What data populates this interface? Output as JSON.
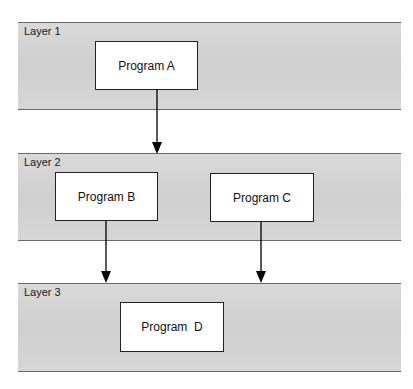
{
  "diagram": {
    "layers": [
      {
        "id": "layer1",
        "label": "Layer 1"
      },
      {
        "id": "layer2",
        "label": "Layer 2"
      },
      {
        "id": "layer3",
        "label": "Layer 3"
      }
    ],
    "programs": [
      {
        "id": "A",
        "label": "Program A",
        "layer": "layer1"
      },
      {
        "id": "B",
        "label": "Program B",
        "layer": "layer2"
      },
      {
        "id": "C",
        "label": "Program C",
        "layer": "layer2"
      },
      {
        "id": "D",
        "label": "Program  D",
        "layer": "layer3"
      }
    ],
    "edges": [
      {
        "from": "A",
        "to": "layer2",
        "description": "Program A calls down into Layer 2"
      },
      {
        "from": "B",
        "to": "layer3",
        "description": "Program B calls down into Layer 3"
      },
      {
        "from": "C",
        "to": "layer3",
        "description": "Program C calls down into Layer 3"
      }
    ],
    "colors": {
      "layer_fill": "#d4d4d4",
      "layer_border": "#6a6a6a",
      "box_fill": "#ffffff",
      "box_border": "#222222",
      "arrow": "#000000"
    }
  }
}
